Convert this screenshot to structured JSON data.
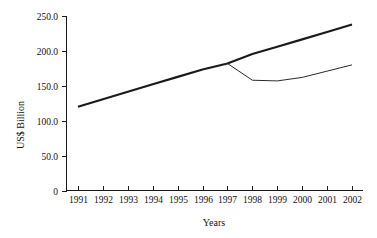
{
  "chart_data": {
    "type": "line",
    "title": "",
    "xlabel": "Years",
    "ylabel": "US$ Billion",
    "categories": [
      "1991",
      "1992",
      "1993",
      "1994",
      "1995",
      "1996",
      "1997",
      "1998",
      "1999",
      "2000",
      "2001",
      "2002"
    ],
    "x": [
      1991,
      1992,
      1993,
      1994,
      1995,
      1996,
      1997,
      1998,
      1999,
      2000,
      2001,
      2002
    ],
    "xlim": [
      1991,
      2002
    ],
    "ylim": [
      0,
      250
    ],
    "yticks": [
      0,
      50,
      100,
      150,
      200,
      250
    ],
    "ytick_labels": [
      "0",
      "50.0",
      "100.0",
      "150.0",
      "200.0",
      "250.0"
    ],
    "xtick_labels": [
      "1991",
      "1992",
      "1993",
      "1994",
      "1995",
      "1996",
      "1997",
      "1998",
      "1999",
      "2000",
      "2001",
      "2002"
    ],
    "grid": false,
    "legend": "none",
    "series": [
      {
        "name": "trend",
        "style": "thick",
        "values": [
          120,
          130.7,
          141.4,
          152.1,
          162.8,
          173.5,
          182,
          195.5,
          206,
          216.5,
          227,
          238
        ]
      },
      {
        "name": "actual",
        "style": "thin",
        "values": [
          null,
          null,
          null,
          null,
          null,
          null,
          182,
          158,
          157,
          162,
          171,
          180
        ]
      }
    ]
  },
  "axis": {
    "y_title": "US$ Billion",
    "x_title": "Years"
  }
}
